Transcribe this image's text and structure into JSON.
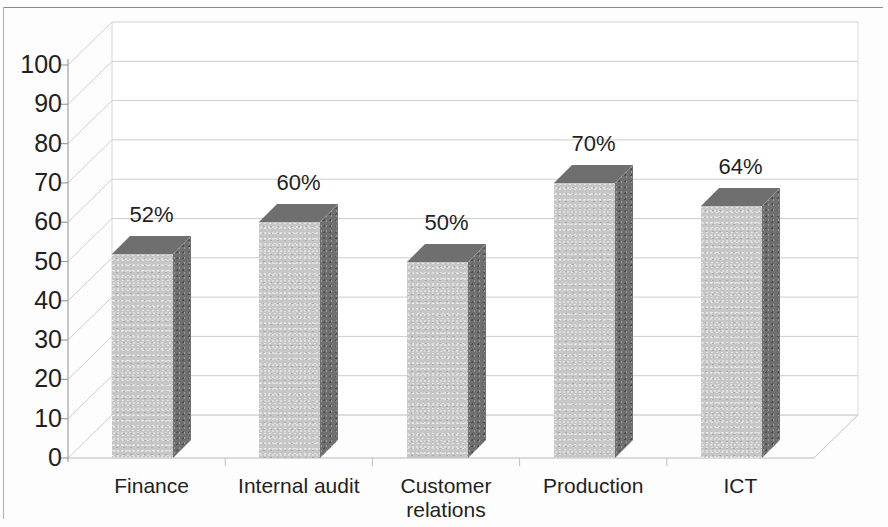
{
  "chart_data": {
    "type": "bar",
    "title": "",
    "subtitle": "",
    "xlabel": "",
    "ylabel": "",
    "categories": [
      "Finance",
      "Internal audit",
      "Customer relations",
      "Production",
      "ICT"
    ],
    "values": [
      52,
      60,
      50,
      70,
      64
    ],
    "data_labels": [
      "52%",
      "60%",
      "50%",
      "70%",
      "64%"
    ],
    "ylim": [
      0,
      100
    ],
    "ytick_labels": [
      "0",
      "10",
      "20",
      "30",
      "40",
      "50",
      "60",
      "70",
      "80",
      "90",
      "100"
    ],
    "ytick_values": [
      0,
      10,
      20,
      30,
      40,
      50,
      60,
      70,
      80,
      90,
      100
    ],
    "grid": true,
    "grid_axis": "y",
    "legend": false,
    "legend_position": "none",
    "style": "3d-column",
    "series": [
      {
        "name": "Percentage",
        "values": [
          52,
          60,
          50,
          70,
          64
        ]
      }
    ],
    "colors": {
      "bar_front": "#c6c6c6",
      "bar_side": "#6f6f6f",
      "bar_top": "#6f6f6f",
      "gridline": "#c9c9c9",
      "axis": "#9a9a9a",
      "text": "#231f20",
      "background": "#ffffff"
    }
  },
  "category_label_lines": [
    [
      "Finance"
    ],
    [
      "Internal audit"
    ],
    [
      "Customer",
      "relations"
    ],
    [
      "Production"
    ],
    [
      "ICT"
    ]
  ]
}
